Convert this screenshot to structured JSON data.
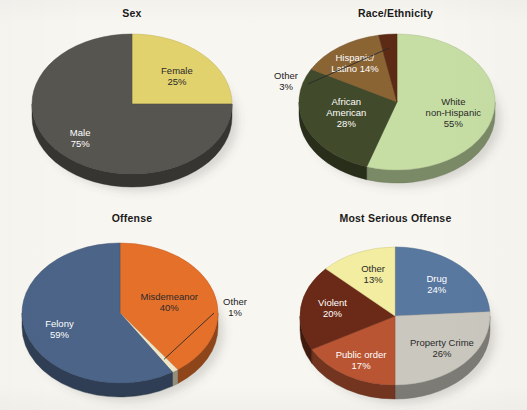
{
  "page": {
    "background_color": "#f8f6f1",
    "figure_count": 4
  },
  "charts": [
    {
      "id": "sex",
      "title": "Sex",
      "chart_data": {
        "type": "pie",
        "title": "Sex",
        "legend": "none",
        "labels_inside": true,
        "start_angle_deg": 0,
        "direction": "clockwise",
        "categories": [
          "Female",
          "Male"
        ],
        "values": [
          25,
          75
        ],
        "value_labels": [
          "25%",
          "75%"
        ],
        "colors": [
          "#e2d26e",
          "#575550"
        ],
        "label_colors": [
          "#2a2a2a",
          "#ffffff"
        ]
      }
    },
    {
      "id": "race-ethnicity",
      "title": "Race/Ethnicity",
      "chart_data": {
        "type": "pie",
        "title": "Race/Ethnicity",
        "legend": "none",
        "labels_inside": true,
        "start_angle_deg": 0,
        "direction": "clockwise",
        "categories": [
          "White non-Hispanic",
          "African American",
          "Hispanic/Latino",
          "Other"
        ],
        "values": [
          55,
          28,
          14,
          3
        ],
        "value_labels": [
          "55%",
          "28%",
          "14%",
          "3%"
        ],
        "colors": [
          "#c6dea4",
          "#414a2a",
          "#8b6434",
          "#5d2a16"
        ],
        "label_colors": [
          "#2a2a2a",
          "#ffffff",
          "#ffffff",
          "#1a1a1a"
        ],
        "callout_categories": [
          "Other"
        ]
      }
    },
    {
      "id": "offense",
      "title": "Offense",
      "chart_data": {
        "type": "pie",
        "title": "Offense",
        "legend": "none",
        "labels_inside": true,
        "start_angle_deg": 0,
        "direction": "clockwise",
        "categories": [
          "Misdemeanor",
          "Other",
          "Felony"
        ],
        "values": [
          40,
          1,
          59
        ],
        "value_labels": [
          "40%",
          "1%",
          "59%"
        ],
        "colors": [
          "#e5702a",
          "#efe7c8",
          "#4b6488"
        ],
        "label_colors": [
          "#2a2a2a",
          "#1a1a1a",
          "#ffffff"
        ],
        "callout_categories": [
          "Other"
        ]
      }
    },
    {
      "id": "most-serious-offense",
      "title": "Most Serious Offense",
      "chart_data": {
        "type": "pie",
        "title": "Most Serious Offense",
        "legend": "none",
        "labels_inside": true,
        "start_angle_deg": 0,
        "direction": "clockwise",
        "categories": [
          "Drug",
          "Property Crime",
          "Public order",
          "Violent",
          "Other"
        ],
        "values": [
          24,
          26,
          17,
          20,
          13
        ],
        "value_labels": [
          "24%",
          "26%",
          "17%",
          "20%",
          "13%"
        ],
        "colors": [
          "#5878a0",
          "#c9c7be",
          "#b95532",
          "#6b2a17",
          "#f2eda0"
        ],
        "label_colors": [
          "#ffffff",
          "#2a2a2a",
          "#ffffff",
          "#ffffff",
          "#2a2a2a"
        ]
      }
    }
  ]
}
